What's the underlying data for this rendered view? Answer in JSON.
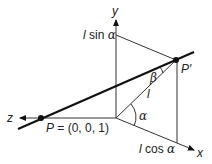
{
  "diagram": {
    "title": "",
    "axes": {
      "x_label": "x",
      "y_label": "y",
      "z_label": "z"
    },
    "points": {
      "P": {
        "label": "P = (0, 0, 1)"
      },
      "P_prime": {
        "label": "P′"
      }
    },
    "labels": {
      "l_sin_alpha_l": "l",
      "l_sin_alpha_rest": " sin ",
      "alpha1": "α",
      "l_cos_alpha_l": "l",
      "l_cos_alpha_rest": " cos ",
      "alpha2": "α",
      "l": "l",
      "alpha_angle": "α",
      "beta_angle": "β"
    },
    "colors": {
      "line": "#111111",
      "thin_line": "#333333"
    }
  }
}
